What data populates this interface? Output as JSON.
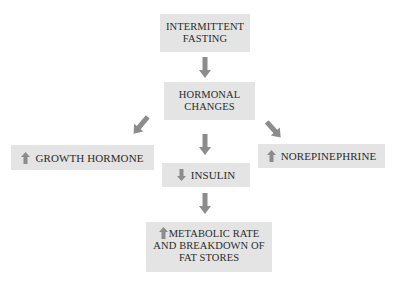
{
  "diagram": {
    "colors": {
      "box_fill": "#e4e4e4",
      "arrow": "#8c8c8c",
      "text": "#2b2b2b",
      "background": "#ffffff"
    },
    "nodes": {
      "fasting": {
        "label": "INTERMITTENT\nFASTING",
        "icon": null
      },
      "hormonal": {
        "label": "HORMONAL\nCHANGES",
        "icon": null
      },
      "growth": {
        "label": "GROWTH HORMONE",
        "icon": "up-arrow-icon"
      },
      "insulin": {
        "label": "INSULIN",
        "icon": "down-arrow-icon"
      },
      "norepinephrine": {
        "label": "NOREPINEPHRINE",
        "icon": "up-arrow-icon"
      },
      "metabolic": {
        "label": "METABOLIC RATE\nAND BREAKDOWN OF\nFAT STORES",
        "icon": "up-arrow-icon"
      }
    },
    "edges": [
      {
        "from": "fasting",
        "to": "hormonal"
      },
      {
        "from": "hormonal",
        "to": "growth"
      },
      {
        "from": "hormonal",
        "to": "insulin"
      },
      {
        "from": "hormonal",
        "to": "norepinephrine"
      },
      {
        "from": "insulin",
        "to": "metabolic"
      }
    ]
  }
}
